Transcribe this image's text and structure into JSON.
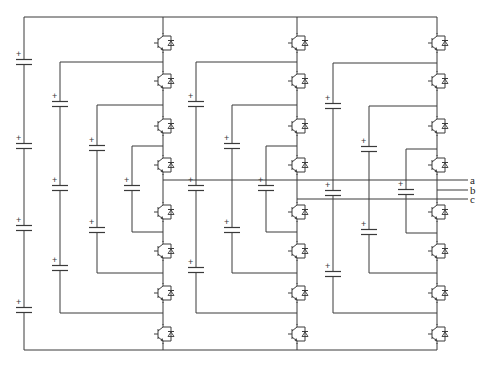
{
  "diagram": {
    "type": "circuit-schematic",
    "colors": {
      "line": "#3a3a3a",
      "background": "#ffffff"
    },
    "rails": {
      "top_y": 17,
      "bottom_y": 350,
      "left_x": 24
    },
    "dc_link": {
      "x": 24,
      "capacitors": [
        62,
        146,
        228,
        310
      ]
    },
    "legs": [
      {
        "phase": "a",
        "x": 163,
        "output_y": 180,
        "igbts": [
          43,
          81,
          126,
          165,
          212,
          251,
          293,
          334
        ],
        "flying_caps": [
          {
            "x": 60,
            "top_y": 62,
            "bottom_y": 313,
            "caps": [
              104,
              188,
              268
            ]
          },
          {
            "x": 97,
            "top_y": 105,
            "bottom_y": 273,
            "caps": [
              148,
              230
            ]
          },
          {
            "x": 132,
            "top_y": 146,
            "bottom_y": 232,
            "caps": [
              188
            ]
          }
        ]
      },
      {
        "phase": "c",
        "x": 297,
        "output_y": 199,
        "igbts": [
          43,
          81,
          126,
          165,
          212,
          251,
          293,
          334
        ],
        "flying_caps": [
          {
            "x": 196,
            "top_y": 62,
            "bottom_y": 313,
            "caps": [
              104,
              188,
              270
            ]
          },
          {
            "x": 232,
            "top_y": 105,
            "bottom_y": 273,
            "caps": [
              146,
              230
            ]
          },
          {
            "x": 266,
            "top_y": 146,
            "bottom_y": 232,
            "caps": [
              188
            ]
          }
        ]
      },
      {
        "phase": "b",
        "x": 437,
        "output_y": 190,
        "igbts": [
          43,
          81,
          126,
          165,
          212,
          251,
          293,
          334
        ],
        "flying_caps": [
          {
            "x": 333,
            "top_y": 63,
            "bottom_y": 313,
            "caps": [
              106,
              193,
              274
            ]
          },
          {
            "x": 369,
            "top_y": 106,
            "bottom_y": 273,
            "caps": [
              149,
              232
            ]
          },
          {
            "x": 406,
            "top_y": 149,
            "bottom_y": 233,
            "caps": [
              192
            ]
          }
        ]
      }
    ],
    "outputs": [
      {
        "label": "a",
        "y": 180,
        "from_x": 163
      },
      {
        "label": "b",
        "y": 190,
        "from_x": 437
      },
      {
        "label": "c",
        "y": 199,
        "from_x": 297
      }
    ],
    "output_end_x": 468,
    "plus_symbol": "+"
  }
}
